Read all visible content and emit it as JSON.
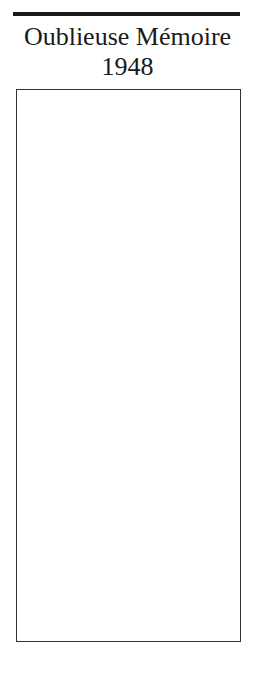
{
  "document": {
    "title": "Oublieuse Mémoire",
    "year": "1948"
  }
}
